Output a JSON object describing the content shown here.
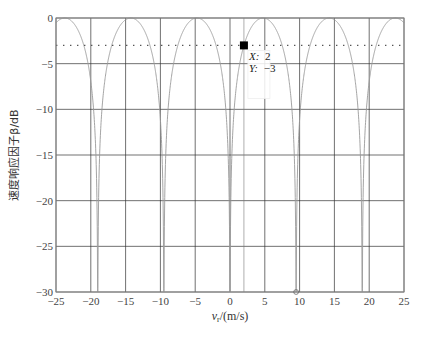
{
  "chart_data": {
    "type": "line",
    "title": "",
    "xlabel": "v_r/(m/s)",
    "xlabel_main": "v",
    "xlabel_sub": "r",
    "xlabel_rest": "/(m/s)",
    "ylabel": "速度响应因子β/dB",
    "xlim": [
      -25,
      25
    ],
    "ylim": [
      -30,
      0
    ],
    "grid": true,
    "x_ticks": [
      -25,
      -20,
      -15,
      -10,
      -5,
      0,
      5,
      10,
      15,
      20,
      25
    ],
    "x_tick_labels": [
      "−25",
      "−20",
      "−15",
      "−10",
      "−5",
      "0",
      "5",
      "10",
      "15",
      "20",
      "25"
    ],
    "y_ticks": [
      0,
      -5,
      -10,
      -15,
      -20,
      -25,
      -30
    ],
    "y_tick_labels": [
      "0",
      "−5",
      "−10",
      "−15",
      "−20",
      "−25",
      "−30"
    ],
    "series": [
      {
        "name": "velocity response factor",
        "style": "solid",
        "color": "#9a9a9a",
        "null_positions": [
          -19,
          -9.5,
          0,
          9.5,
          19
        ],
        "peak_positions": [
          -23.75,
          -14.25,
          -4.75,
          4.75,
          14.25,
          23.75
        ],
        "peak_value": 0,
        "x": [
          -25,
          -23.75,
          -21.4,
          -19,
          -16.6,
          -14.25,
          -11.9,
          -9.5,
          -7.1,
          -4.75,
          -2.4,
          0,
          2,
          2.4,
          4.75,
          7.1,
          9.5,
          11.9,
          14.25,
          16.6,
          19,
          21.4,
          23.75,
          25
        ],
        "y": [
          -0.5,
          0,
          -2.1,
          -30,
          -2.1,
          0,
          -2.1,
          -30,
          -2.1,
          0,
          -2.1,
          -30,
          -3,
          -2.1,
          0,
          -2.1,
          -30,
          -2.1,
          0,
          -2.1,
          -30,
          -2.1,
          0,
          -0.5
        ]
      },
      {
        "name": "-3 dB reference",
        "style": "dotted",
        "color": "#555555",
        "x": [
          -25,
          25
        ],
        "y": [
          -3,
          -3
        ]
      }
    ],
    "annotations": [
      {
        "type": "datatip",
        "x": 2,
        "y": -3,
        "label_x": "X: 2",
        "label_y": "Y: -3"
      },
      {
        "type": "marker-circle",
        "x": 9.5,
        "y": -30
      }
    ],
    "cursor_line_x": 2
  },
  "datatip": {
    "x_key": "X:",
    "x_val": "2",
    "y_key": "Y:",
    "y_val": "−3"
  },
  "colors": {
    "grid": "#333333",
    "axes": "#888888",
    "curve": "#9a9a9a",
    "reference": "#555555",
    "marker": "#000000"
  }
}
